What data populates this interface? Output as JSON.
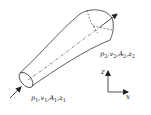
{
  "diagram": {
    "type": "streamtube",
    "inlet_label": {
      "p": "p",
      "p_sub": "1",
      "v": "v",
      "v_sub": "1",
      "A": "A",
      "A_sub": "1",
      "z": "z",
      "z_sub": "1"
    },
    "outlet_label": {
      "p": "p",
      "p_sub": "2",
      "v": "v",
      "v_sub": "2",
      "A": "A",
      "A_sub": "2",
      "z": "z",
      "z_sub": "2"
    },
    "axes": {
      "vertical": "z",
      "horizontal": "x"
    },
    "colors": {
      "stroke": "#333333",
      "background": "#ffffff"
    }
  }
}
